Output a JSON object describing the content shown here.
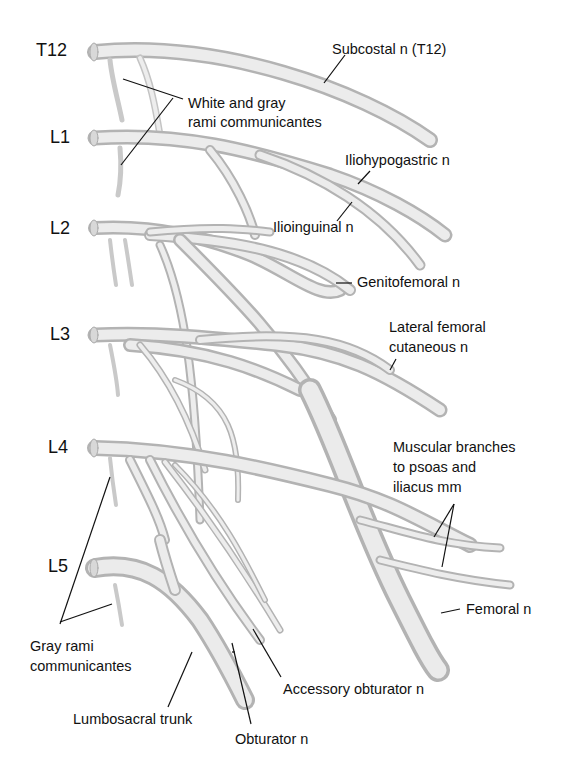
{
  "figure": {
    "segments": [
      "T12",
      "L1",
      "L2",
      "L3",
      "L4",
      "L5"
    ],
    "labels": {
      "subcostal": "Subcostal n (T12)",
      "white_gray_rami_1": "White and gray",
      "white_gray_rami_2": "rami communicantes",
      "iliohypogastric": "Iliohypogastric n",
      "ilioinguinal": "Ilioinguinal n",
      "genitofemoral": "Genitofemoral n",
      "lat_fem_cut_1": "Lateral femoral",
      "lat_fem_cut_2": "cutaneous n",
      "muscular_1": "Muscular branches",
      "muscular_2": "to psoas and",
      "muscular_3": "iliacus mm",
      "femoral": "Femoral n",
      "gray_rami_1": "Gray rami",
      "gray_rami_2": "communicantes",
      "accessory_obturator": "Accessory obturator n",
      "lumbosacral_trunk": "Lumbosacral trunk",
      "obturator": "Obturator n"
    },
    "colors": {
      "nerve_fill": "#e2e2e2",
      "nerve_shadow": "#b8b8b8",
      "nerve_highlight": "#f7f7f7",
      "leader_line": "#111111",
      "background": "#ffffff"
    }
  }
}
